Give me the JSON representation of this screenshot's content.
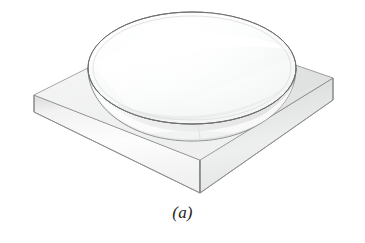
{
  "figure": {
    "caption": "(a)",
    "style": "isometric line-shaded technical illustration",
    "background_color": "#ffffff",
    "outline_color": "#6e6e6e",
    "parts": [
      {
        "name": "flat-glass-plate",
        "description": "Square flat slab drawn in isometric projection beneath the lens",
        "top_face_color": "#eceded",
        "front_left_face_color": "#f4f4f4",
        "front_right_face_color": "#dcdddd",
        "edge_color": "#7a7a7a"
      },
      {
        "name": "plano-convex-lens",
        "description": "Circular lens with flat top face and convex curved lower surface touching the plate",
        "top_face_color": "#f7f8f8",
        "curved_face_color": "#fbfbfb",
        "highlight_color": "#ffffff",
        "edge_color": "#6e6e6e"
      }
    ],
    "geometry": {
      "plate": {
        "left_corner": [
          34,
          95
        ],
        "back_corner": [
          176,
          24
        ],
        "right_corner": [
          333,
          78
        ],
        "front_corner": [
          200,
          160
        ],
        "left_thickness_px": 17,
        "front_thickness_px": 33,
        "right_thickness_px": 22
      },
      "lens": {
        "center": [
          192,
          68
        ],
        "radius_x": 104,
        "radius_y": 56,
        "curved_bottom_y": 140
      }
    }
  }
}
